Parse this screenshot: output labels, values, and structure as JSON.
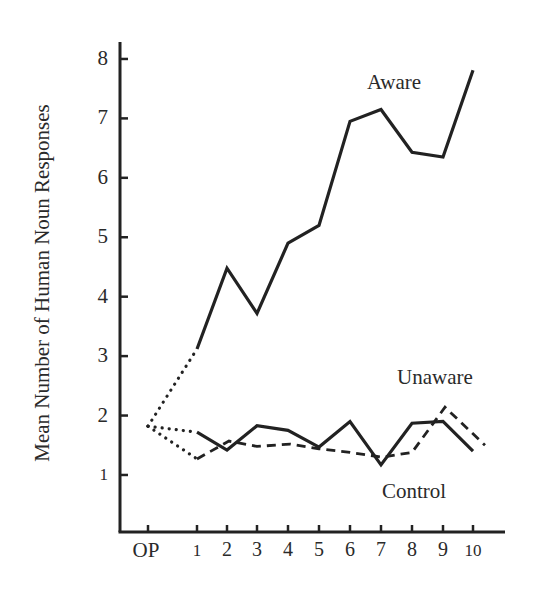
{
  "chart_data": {
    "type": "line",
    "title": "",
    "xlabel": "",
    "ylabel": "Mean Number of Human Noun Responses",
    "categories": [
      "OP",
      "1",
      "2",
      "3",
      "4",
      "5",
      "6",
      "7",
      "8",
      "9",
      "10"
    ],
    "ylim": [
      0,
      8
    ],
    "yticks": [
      1,
      2,
      3,
      4,
      5,
      6,
      7,
      8
    ],
    "grid": false,
    "legend": "inline labels",
    "operant_level": 1.82,
    "series": [
      {
        "name": "Aware",
        "style": "solid",
        "values": [
          1.82,
          3.12,
          4.48,
          3.72,
          4.9,
          5.2,
          6.95,
          7.15,
          6.43,
          6.35,
          7.81
        ]
      },
      {
        "name": "Unaware",
        "style": "dashed",
        "values": [
          1.82,
          1.27,
          1.57,
          1.48,
          1.52,
          1.44,
          1.38,
          1.3,
          1.38,
          2.14,
          1.5
        ]
      },
      {
        "name": "Control",
        "style": "solid",
        "values": [
          1.82,
          1.72,
          1.42,
          1.83,
          1.75,
          1.47,
          1.9,
          1.17,
          1.87,
          1.9,
          1.4
        ]
      }
    ],
    "annotations": [
      "OP to trial 1 segments drawn dotted"
    ]
  },
  "labels": {
    "ylabel": "Mean Number of Human Noun Responses",
    "aware": "Aware",
    "unaware": "Unaware",
    "control": "Control"
  },
  "colors": {
    "ink": "#222222",
    "background": "#ffffff"
  }
}
